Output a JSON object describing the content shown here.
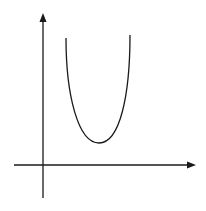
{
  "diagram": {
    "type": "parabola-graph",
    "axes": {
      "y_axis": {
        "x": 43,
        "y_top": 14,
        "y_bottom": 198
      },
      "x_axis": {
        "y": 165,
        "x_left": 14,
        "x_right": 196
      }
    },
    "curve": {
      "start": [
        66,
        38
      ],
      "vertex": [
        99,
        143
      ],
      "end": [
        130,
        35
      ]
    },
    "colors": {
      "line": "#1a1a1a",
      "background": "#ffffff"
    }
  }
}
